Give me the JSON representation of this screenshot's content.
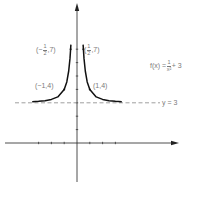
{
  "chart_data": {
    "type": "line",
    "title": "",
    "function_label": {
      "lhs": "f(x) =",
      "num": "1",
      "den": "x²",
      "rhs": "+ 3"
    },
    "asymptote": {
      "y": 3,
      "label": "y = 3",
      "style": "dashed"
    },
    "points": [
      {
        "x": -0.5,
        "y": 7,
        "label_prefix": "(−",
        "label_num": "1",
        "label_den": "2",
        "label_suffix": ",7)"
      },
      {
        "x": 0.5,
        "y": 7,
        "label_prefix": "(",
        "label_num": "1",
        "label_den": "2",
        "label_suffix": ",7)"
      },
      {
        "x": -1,
        "y": 4,
        "label": "(−1,4)"
      },
      {
        "x": 1,
        "y": 4,
        "label": "(1,4)"
      }
    ],
    "series": [
      {
        "name": "f(x) = 1/x² + 3 (x<0)",
        "x": [
          -3.5,
          -3,
          -2.5,
          -2,
          -1.5,
          -1,
          -0.8,
          -0.65,
          -0.55,
          -0.5,
          -0.48
        ],
        "y": [
          3.08,
          3.11,
          3.16,
          3.25,
          3.44,
          4,
          4.56,
          5.37,
          6.31,
          7,
          7.34
        ]
      },
      {
        "name": "f(x) = 1/x² + 3 (x>0)",
        "x": [
          0.48,
          0.5,
          0.55,
          0.65,
          0.8,
          1,
          1.5,
          2,
          2.5,
          3,
          3.5
        ],
        "y": [
          7.34,
          7,
          6.31,
          5.37,
          4.56,
          4,
          3.44,
          3.25,
          3.16,
          3.11,
          3.08
        ]
      }
    ],
    "xlabel": "",
    "ylabel": "",
    "xlim": [
      -5.6,
      7.9
    ],
    "ylim": [
      -3,
      10.5
    ],
    "x_ticks": [
      -3,
      -2,
      -1,
      1,
      2,
      3
    ],
    "y_ticks": [
      1,
      2,
      3,
      4,
      5,
      6,
      7
    ],
    "grid": false,
    "legend": "none"
  }
}
